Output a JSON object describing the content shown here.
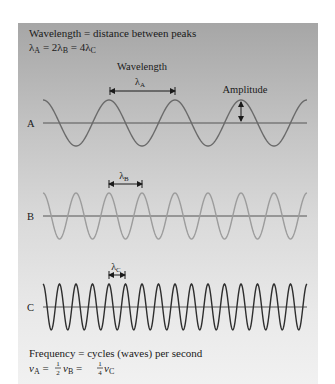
{
  "header": {
    "line1": "Wavelength = distance between peaks",
    "line2": {
      "l1": "λ",
      "s1": "A",
      "m1": " = 2λ",
      "s2": "B",
      "m2": " = 4λ",
      "s3": "C"
    }
  },
  "annotations": {
    "wavelength_label": "Wavelength",
    "amplitude_label": "Amplitude",
    "lambda_a": {
      "sym": "λ",
      "sub": "A"
    },
    "lambda_b": {
      "sym": "λ",
      "sub": "B"
    },
    "lambda_c": {
      "sym": "λ",
      "sub": "C"
    }
  },
  "waves": [
    {
      "label": "A",
      "wavelength_px": 66,
      "axis_y": 123,
      "amplitude_px": 23,
      "color": "#6a6a6a"
    },
    {
      "label": "B",
      "wavelength_px": 33,
      "axis_y": 216,
      "amplitude_px": 23,
      "color": "#9c9c9c"
    },
    {
      "label": "C",
      "wavelength_px": 16.5,
      "axis_y": 307,
      "amplitude_px": 23,
      "color": "#2e2e2e"
    }
  ],
  "footer": {
    "line1": "Frequency = cycles (waves) per second",
    "line2": {
      "v": "ν",
      "s1": "A",
      "m1": " = ",
      "f1n": "1",
      "f1d": "2",
      "v2": "ν",
      "s2": "B",
      "m2": " = ",
      "f2n": "1",
      "f2d": "4",
      "v3": "ν",
      "s3": "C"
    }
  },
  "colors": {
    "axis": "#555555",
    "text": "#1a1a1a"
  }
}
